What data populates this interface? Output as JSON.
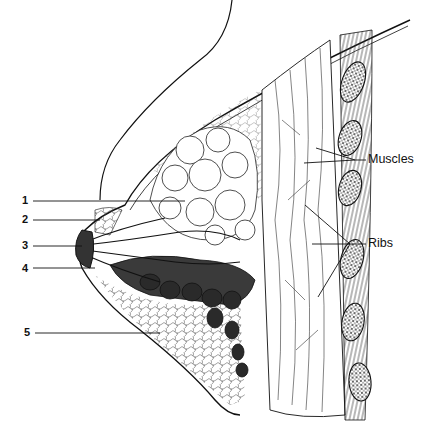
{
  "diagram": {
    "numbered_labels": [
      {
        "id": "1",
        "x": 22,
        "y": 200,
        "line_to": [
          185,
          201
        ]
      },
      {
        "id": "2",
        "x": 22,
        "y": 217,
        "line_to": [
          100,
          220
        ]
      },
      {
        "id": "3",
        "x": 22,
        "y": 245,
        "line_to": [
          80,
          246
        ]
      },
      {
        "id": "4",
        "x": 22,
        "y": 268,
        "line_to": [
          95,
          268
        ]
      },
      {
        "id": "5",
        "x": 24,
        "y": 332,
        "line_to": [
          160,
          333
        ]
      }
    ],
    "named_labels": [
      {
        "text": "Muscles",
        "x": 368,
        "y": 157
      },
      {
        "text": "Ribs",
        "x": 368,
        "y": 241
      }
    ],
    "colors": {
      "ink": "#111111",
      "background": "#ffffff",
      "dark_fill": "#2a2a2a",
      "mid_fill": "#555555"
    }
  }
}
